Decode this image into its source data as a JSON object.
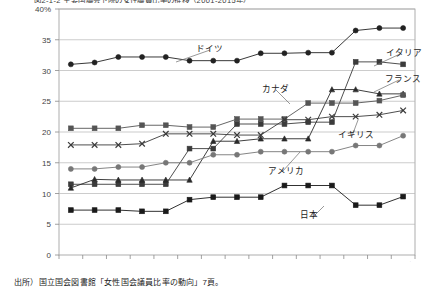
{
  "figure": {
    "title": "図2-1-2  主要国議会下院の女性議員比率の推移（2001-2015年）",
    "source": "出所）国立国会図書館「女性国会議員比率の動向」7頁。"
  },
  "axes": {
    "y_unit_label": "40%",
    "y_ticks": [
      "0",
      "5",
      "10",
      "15",
      "20",
      "25",
      "30",
      "35",
      "40%"
    ],
    "x_ticks": [
      "2001",
      "2002",
      "2003",
      "2004",
      "2005",
      "2006",
      "2007",
      "2008",
      "2009",
      "2010",
      "2011",
      "2012",
      "2013",
      "2014",
      "2015年"
    ]
  },
  "chart_data": {
    "type": "line",
    "title": "図2-1-2  主要国議会下院の女性議員比率の推移（2001-2015年）",
    "xlabel": "年",
    "ylabel": "%",
    "ylim": [
      0,
      40
    ],
    "grid": true,
    "legend": "inline-annotations",
    "x": [
      "2001",
      "2002",
      "2003",
      "2004",
      "2005",
      "2006",
      "2007",
      "2008",
      "2009",
      "2010",
      "2011",
      "2012",
      "2013",
      "2014",
      "2015"
    ],
    "series": [
      {
        "name": "ドイツ",
        "marker": "circle-filled",
        "color": "#222222",
        "label_pos": {
          "x": 196,
          "y": 48
        },
        "leader_to": {
          "x": 176,
          "y": 62
        },
        "values": [
          31.0,
          31.3,
          32.2,
          32.2,
          32.2,
          31.6,
          31.6,
          31.6,
          32.8,
          32.8,
          32.9,
          32.9,
          36.5,
          36.9,
          36.9
        ]
      },
      {
        "name": "イタリア",
        "marker": "square-filled",
        "color": "#3b3b3b",
        "label_pos": {
          "x": 386,
          "y": 52
        },
        "leader_to": {
          "x": 374,
          "y": 66
        },
        "values": [
          11.5,
          11.5,
          11.5,
          11.5,
          11.5,
          17.3,
          17.3,
          21.3,
          21.3,
          21.3,
          21.6,
          21.6,
          31.4,
          31.4,
          31.0
        ]
      },
      {
        "name": "フランス",
        "marker": "triangle-filled",
        "color": "#2a2a2a",
        "label_pos": {
          "x": 385,
          "y": 78
        },
        "leader_to": {
          "x": 374,
          "y": 92
        },
        "values": [
          10.9,
          12.3,
          12.2,
          12.2,
          12.2,
          12.2,
          18.5,
          18.5,
          18.9,
          18.9,
          18.9,
          26.9,
          26.9,
          26.2,
          26.2
        ]
      },
      {
        "name": "カナダ",
        "marker": "square-filled",
        "color": "#555555",
        "label_pos": {
          "x": 262,
          "y": 88
        },
        "leader_to": {
          "x": 290,
          "y": 104
        },
        "values": [
          20.6,
          20.6,
          20.6,
          21.1,
          21.1,
          20.8,
          20.8,
          22.1,
          22.1,
          22.1,
          24.7,
          24.7,
          24.7,
          25.1,
          26.0
        ]
      },
      {
        "name": "イギリス",
        "marker": "cross-x",
        "color": "#3a3a3a",
        "label_pos": {
          "x": 338,
          "y": 134
        },
        "leader_to": {
          "x": 358,
          "y": 120
        },
        "values": [
          17.9,
          17.9,
          17.9,
          18.1,
          19.7,
          19.7,
          19.7,
          19.5,
          19.5,
          22.0,
          22.0,
          22.5,
          22.5,
          22.8,
          23.5
        ]
      },
      {
        "name": "アメリカ",
        "marker": "circle-gray",
        "color": "#777777",
        "label_pos": {
          "x": 268,
          "y": 170
        },
        "leader_to": {
          "x": 300,
          "y": 152
        },
        "values": [
          14.0,
          14.0,
          14.3,
          14.3,
          15.0,
          15.0,
          16.3,
          16.3,
          16.8,
          16.8,
          16.8,
          16.8,
          17.8,
          17.8,
          19.4
        ]
      },
      {
        "name": "日本",
        "marker": "square-filled",
        "color": "#1a1a1a",
        "label_pos": {
          "x": 300,
          "y": 214
        },
        "leader_to": {
          "x": 324,
          "y": 206
        },
        "values": [
          7.3,
          7.3,
          7.3,
          7.1,
          7.1,
          9.0,
          9.4,
          9.4,
          9.4,
          11.3,
          11.3,
          11.3,
          8.1,
          8.1,
          9.5
        ]
      }
    ]
  }
}
